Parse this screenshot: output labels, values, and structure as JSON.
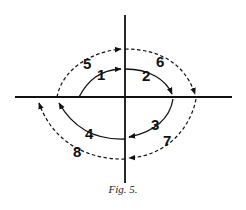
{
  "figure": {
    "caption": "Fig. 5.",
    "colors": {
      "line": "#111111",
      "background": "#ffffff"
    },
    "axes": {
      "horizontal": {
        "x1": 15,
        "y": 97,
        "x2": 232
      },
      "vertical": {
        "x": 125,
        "y1": 15,
        "y2": 183
      }
    },
    "paths": [
      {
        "id": 1,
        "label": "1",
        "style": "solid",
        "direction": "toward vertical axis (upper-left to top)"
      },
      {
        "id": 2,
        "label": "2",
        "style": "solid",
        "direction": "top to right axis crossing"
      },
      {
        "id": 3,
        "label": "3",
        "style": "solid",
        "direction": "right axis crossing to bottom"
      },
      {
        "id": 4,
        "label": "4",
        "style": "solid",
        "direction": "bottom to left axis crossing"
      },
      {
        "id": 5,
        "label": "5",
        "style": "dashed",
        "direction": "left axis crossing to top"
      },
      {
        "id": 6,
        "label": "6",
        "style": "dashed",
        "direction": "top to right axis crossing"
      },
      {
        "id": 7,
        "label": "7",
        "style": "dashed",
        "direction": "right axis crossing to bottom"
      },
      {
        "id": 8,
        "label": "8",
        "style": "dashed",
        "direction": "bottom to left axis crossing"
      }
    ]
  }
}
